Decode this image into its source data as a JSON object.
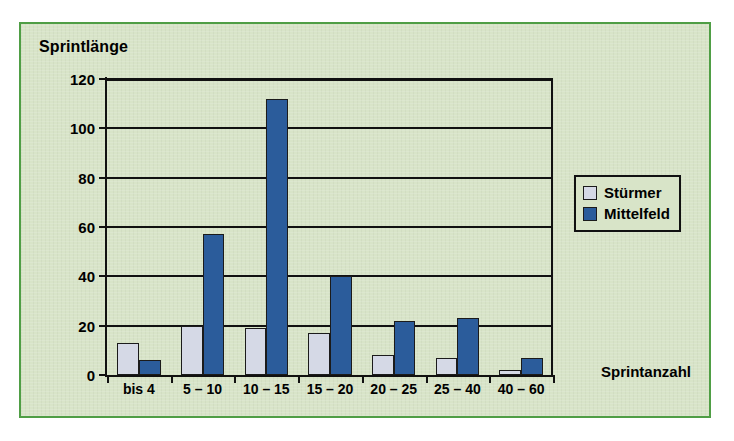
{
  "chart_data": {
    "type": "bar",
    "title": "",
    "ylabel": "Sprintlänge",
    "xlabel": "Sprintanzahl",
    "categories": [
      "bis 4",
      "5 – 10",
      "10 – 15",
      "15 – 20",
      "20 – 25",
      "25 – 40",
      "40 – 60"
    ],
    "series": [
      {
        "name": "Stürmer",
        "color": "#d5d9e6",
        "values": [
          13,
          20,
          19,
          17,
          8,
          7,
          2
        ]
      },
      {
        "name": "Mittelfeld",
        "color": "#2b5c9b",
        "values": [
          6,
          57,
          112,
          40,
          22,
          23,
          7
        ]
      }
    ],
    "ylim": [
      0,
      120
    ],
    "yticks": [
      0,
      20,
      40,
      60,
      80,
      100,
      120
    ],
    "ytick_labels": [
      "0",
      "20",
      "40",
      "60",
      "80",
      "100",
      "120"
    ],
    "grid": true,
    "legend_position": "right",
    "background_color": "#d8e4c8",
    "border_color": "#4f9e45",
    "axis_color": "#111111"
  }
}
